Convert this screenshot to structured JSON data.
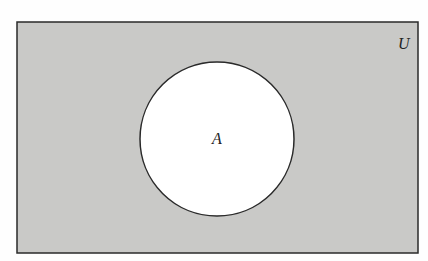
{
  "diagram": {
    "type": "venn",
    "shaded_region": "complement of A",
    "universe_label": "U",
    "sets": [
      {
        "label": "A"
      }
    ],
    "colors": {
      "shade": "#c9c9c7",
      "set_fill": "#ffffff",
      "stroke": "#2a2a2a"
    }
  }
}
